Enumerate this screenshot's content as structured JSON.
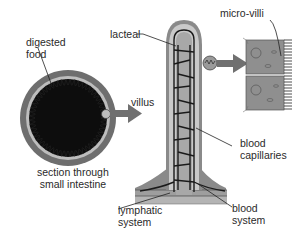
{
  "diagram": {
    "labels": {
      "digested_food": [
        "digested",
        "food"
      ],
      "lacteal": "lacteal",
      "villus": "villus",
      "micro_villi": "micro-villi",
      "section": [
        "section through",
        "small intestine"
      ],
      "blood_capillaries": [
        "blood",
        "capillaries"
      ],
      "lymphatic_system": [
        "lymphatic",
        "system"
      ],
      "blood_system": [
        "blood",
        "system"
      ]
    },
    "colors": {
      "outer_wall": "#6e6e6e",
      "inner_wall": "#bdbdbd",
      "lumen": "#0d0d0d",
      "villus_outer": "#8a8a8a",
      "villus_inner": "#c9c9c9",
      "lacteal": "#a8a8a8",
      "capillary": "#1a1a1a",
      "cell": "#8f8f8f",
      "arrow": "#707070",
      "text": "#2a2a2a"
    }
  }
}
